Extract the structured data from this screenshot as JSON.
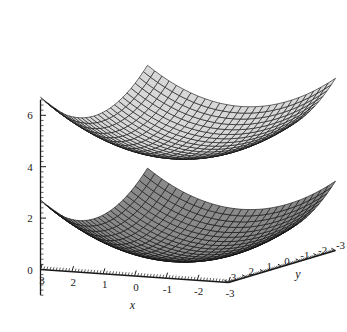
{
  "figure": {
    "kind": "3d-surface-plot",
    "background_color": "#ffffff",
    "axis_color": "#1a1a1a"
  },
  "chart_data": {
    "type": "surface",
    "title": "",
    "xlabel": "x",
    "ylabel": "y",
    "zlabel": "",
    "xlim": [
      3,
      -3
    ],
    "ylim": [
      3,
      -3
    ],
    "zlim": [
      -1,
      6.5
    ],
    "grid": false,
    "legend": "none",
    "projection": "3d-oblique",
    "axes": {
      "x": {
        "label": "x",
        "ticks": [
          "3",
          "2",
          "1",
          "0",
          "-1",
          "-2",
          "-3"
        ],
        "tick_values": [
          3,
          2,
          1,
          0,
          -1,
          -2,
          -3
        ],
        "direction": "left-to-right-descending"
      },
      "y": {
        "label": "y",
        "ticks": [
          "3",
          "2",
          "1",
          "0",
          "-1",
          "-2",
          "-3"
        ],
        "tick_values": [
          3,
          2,
          1,
          0,
          -1,
          -2,
          -3
        ],
        "direction": "lower-left-to-upper-right"
      },
      "z": {
        "label": "",
        "ticks": [
          "0",
          "2",
          "4",
          "6"
        ],
        "tick_values": [
          0,
          2,
          4,
          6
        ],
        "direction": "vertical"
      }
    },
    "series": [
      {
        "name": "upper-surface",
        "shape": "elliptic-paraboloid",
        "face_color": "#d8d8d8",
        "mesh_color": "#151515",
        "z_offset": 4.0,
        "curvature": 0.3,
        "grid_u": 26,
        "grid_v": 26
      },
      {
        "name": "lower-surface",
        "shape": "elliptic-paraboloid",
        "face_color": "#8a8a8a",
        "mesh_color": "#101010",
        "z_offset": 0.0,
        "curvature": 0.3,
        "grid_u": 26,
        "grid_v": 26
      }
    ]
  }
}
